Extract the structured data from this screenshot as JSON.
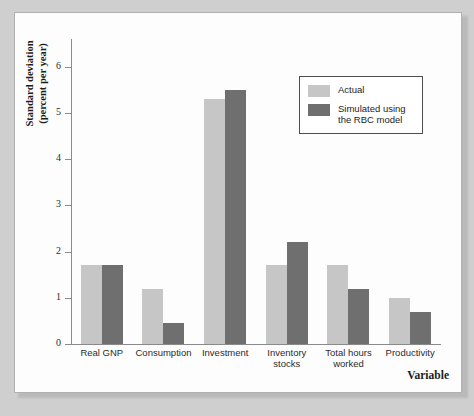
{
  "chart_data": {
    "type": "bar",
    "title": "",
    "categories": [
      "Real GNP",
      "Consumption",
      "Investment",
      "Inventory stocks",
      "Total hours worked",
      "Productivity"
    ],
    "series": [
      {
        "name": "Actual",
        "values": [
          1.7,
          1.2,
          5.3,
          1.7,
          1.7,
          1.0
        ],
        "color": "#c6c6c6"
      },
      {
        "name": "Simulated using the RBC model",
        "values": [
          1.7,
          0.45,
          5.5,
          2.2,
          1.2,
          0.7
        ],
        "color": "#6f6f6f"
      }
    ],
    "xlabel": "Variable",
    "ylabel": "Standard deviation (percent per year)",
    "ylim": [
      0,
      6.6
    ],
    "yticks": [
      0,
      1,
      2,
      3,
      4,
      5,
      6
    ],
    "ytick_labels": [
      "0",
      "1",
      "2",
      "3",
      "4",
      "5",
      "6"
    ],
    "grid": false,
    "legend_position": "upper right"
  },
  "axes": {
    "y_title_line1": "Standard deviation",
    "y_title_line2": "(percent per year)",
    "x_title": "Variable"
  },
  "legend": {
    "items": [
      {
        "label": "Actual"
      },
      {
        "label": "Simulated using the RBC model"
      }
    ]
  }
}
